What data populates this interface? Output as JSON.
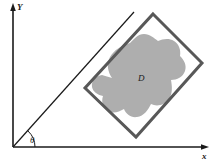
{
  "figure": {
    "background_color": "#ffffff"
  },
  "axes": {
    "x_label": "x",
    "y_label": "Y",
    "axis_color": "#1a1a1a",
    "origin": {
      "x": 13,
      "y": 147
    },
    "x_axis_end": {
      "x": 209,
      "y": 147
    },
    "y_axis_end": {
      "x": 13,
      "y": 5
    }
  },
  "angle": {
    "label": "θ",
    "label_position": {
      "x": 31,
      "y": 142
    },
    "arc_radius": 22,
    "degrees": 47
  },
  "ray": {
    "name": "rotation-ray",
    "from": {
      "x": 13,
      "y": 147
    },
    "to": {
      "x": 134,
      "y": 12
    },
    "color": "#1a1a1a"
  },
  "rectangle": {
    "name": "rotated-rectangle",
    "stroke_color": "#585858",
    "stroke_width": 3,
    "fill": "none",
    "corners": [
      {
        "x": 153,
        "y": 14
      },
      {
        "x": 202,
        "y": 63
      },
      {
        "x": 136,
        "y": 137
      },
      {
        "x": 85,
        "y": 88
      }
    ]
  },
  "region": {
    "name": "region-d",
    "label": "D",
    "label_position": {
      "x": 141,
      "y": 80
    },
    "fill_color": "#aeaeae",
    "path": "M 112 78 C 108 72 106 64 110 57 C 114 50 122 45 130 43 C 134 39 138 34 144 34 C 150 34 154 38 158 41 C 163 39 169 38 174 41 C 179 44 181 50 180 56 C 184 60 187 65 185 71 C 183 77 177 80 171 80 C 172 86 173 93 169 99 C 165 105 157 107 151 104 C 148 110 144 116 137 117 C 131 118 126 114 124 109 C 119 112 113 114 108 111 C 103 108 101 102 103 96 C 98 95 93 92 92 87 C 91 81 96 76 102 75 C 105 76 109 77 112 78 Z"
  }
}
